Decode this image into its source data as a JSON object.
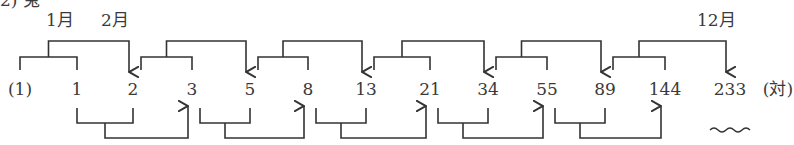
{
  "header_fragment": "2)  兎",
  "month_labels": [
    {
      "text": "1月",
      "x": 46,
      "y": 12
    },
    {
      "text": "2月",
      "x": 101,
      "y": 12
    },
    {
      "text": "12月",
      "x": 697,
      "y": 12
    }
  ],
  "sequence": {
    "prefix": "(1)",
    "numbers": [
      "1",
      "2",
      "3",
      "5",
      "8",
      "13",
      "21",
      "34",
      "55",
      "89",
      "144",
      "233"
    ],
    "suffix": "(対)",
    "x_positions": [
      20,
      77,
      133,
      192,
      250,
      308,
      366,
      430,
      488,
      547,
      605,
      665,
      730
    ]
  },
  "annotation": "wavy underline under 233",
  "colors": {
    "line": "#333333",
    "text": "#3a3a3a"
  }
}
